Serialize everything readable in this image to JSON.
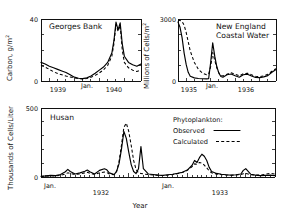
{
  "figure": {
    "background_color": "#ffffff",
    "line_color": "#000000"
  },
  "legend": {
    "heading": "Phytoplankton:",
    "observed_label": "Observed",
    "calculated_label": "Calculated",
    "observed_style": "solid",
    "calculated_style": "dashed"
  },
  "panels": {
    "georges_bank": {
      "title": "Georges Bank",
      "ylabel": "Carbon, g/m",
      "ylabel_sup": "2",
      "ytick_top": "40",
      "ytick_bottom": "0",
      "xticks": [
        "1939",
        "Jan.",
        "1940"
      ]
    },
    "new_england": {
      "title_line1": "New England",
      "title_line2": "Coastal Water",
      "ylabel": "Millions of Cells/m",
      "ylabel_sup": "2",
      "ytick_top": "3000",
      "ytick_bottom": "0",
      "xticks": [
        "1935",
        "Jan.",
        "1936"
      ]
    },
    "husan": {
      "title": "Husan",
      "ylabel": "Thousands of Cells/Liter",
      "ytick_top": "500",
      "ytick_bottom": "0",
      "xticks": [
        "Jan.",
        "1932",
        "Jan.",
        "1933"
      ],
      "xlabel": "Year"
    }
  },
  "chart_data": [
    {
      "id": "georges_bank",
      "type": "line",
      "title": "Georges Bank",
      "xlabel": "",
      "ylabel": "Carbon, g/m2",
      "ylim": [
        0,
        40
      ],
      "yticks": [
        0,
        40
      ],
      "xlim": [
        0,
        24
      ],
      "xtick_labels": [
        "1939",
        "Jan.",
        "1940"
      ],
      "xtick_positions": [
        4.5,
        11.5,
        18
      ],
      "grid": false,
      "legend": "none",
      "series": [
        {
          "name": "Observed",
          "style": "solid",
          "x": [
            0,
            1,
            2,
            3,
            4,
            5,
            6,
            7,
            8,
            9,
            10,
            11,
            12,
            13,
            14,
            15,
            16,
            17,
            17.5,
            18,
            18.5,
            19,
            19.5,
            20,
            21,
            22,
            23,
            24
          ],
          "values": [
            12.0,
            11.0,
            9.5,
            8.5,
            7.5,
            6.5,
            5.5,
            4.0,
            2.5,
            1.8,
            1.5,
            2.0,
            3.2,
            5.0,
            7.0,
            9.0,
            12.0,
            18.0,
            26.0,
            38.0,
            33.0,
            37.5,
            24.0,
            16.0,
            12.0,
            10.5,
            9.5,
            11.0
          ]
        },
        {
          "name": "Calculated",
          "style": "dashed",
          "x": [
            0,
            1,
            2,
            3,
            4,
            5,
            6,
            7,
            8,
            9,
            10,
            11,
            12,
            13,
            14,
            15,
            16,
            17,
            17.5,
            18,
            18.5,
            19,
            19.5,
            20,
            21,
            22,
            23,
            24
          ],
          "values": [
            10.0,
            9.0,
            7.5,
            6.0,
            4.8,
            4.0,
            3.2,
            2.6,
            2.0,
            1.5,
            1.3,
            1.6,
            2.4,
            3.6,
            5.2,
            7.2,
            10.0,
            16.0,
            24.0,
            36.5,
            32.0,
            36.0,
            20.0,
            12.0,
            8.5,
            7.0,
            6.2,
            7.0
          ]
        }
      ]
    },
    {
      "id": "new_england",
      "type": "line",
      "title": "New England Coastal Water",
      "xlabel": "",
      "ylabel": "Millions of Cells/m2",
      "ylim": [
        0,
        3000
      ],
      "yticks": [
        0,
        3000
      ],
      "xlim": [
        0,
        24
      ],
      "xtick_labels": [
        "1935",
        "Jan.",
        "1936"
      ],
      "xtick_positions": [
        2.5,
        8.5,
        17
      ],
      "grid": false,
      "legend": "none",
      "series": [
        {
          "name": "Observed",
          "style": "solid",
          "x": [
            0,
            0.5,
            1,
            1.5,
            2,
            2.5,
            3,
            4,
            5,
            6,
            7,
            7.5,
            8,
            8.5,
            9,
            9.5,
            10,
            10.5,
            11,
            12,
            13,
            14,
            15,
            16,
            17,
            18,
            19,
            20,
            21,
            22,
            23,
            24
          ],
          "values": [
            2850,
            2600,
            2100,
            1350,
            800,
            420,
            230,
            150,
            120,
            110,
            105,
            110,
            900,
            1850,
            1200,
            700,
            380,
            220,
            180,
            300,
            340,
            250,
            180,
            300,
            330,
            240,
            170,
            160,
            200,
            260,
            420,
            560
          ]
        },
        {
          "name": "Calculated",
          "style": "dashed",
          "x": [
            0,
            0.5,
            1,
            1.5,
            2,
            2.5,
            3,
            4,
            5,
            6,
            7,
            7.5,
            8,
            8.5,
            9,
            9.5,
            10,
            10.5,
            11,
            12,
            13,
            14,
            15,
            16,
            17,
            18,
            19,
            20,
            21,
            22,
            23,
            24
          ],
          "values": [
            2950,
            2930,
            2880,
            2700,
            2350,
            1900,
            1450,
            900,
            560,
            380,
            300,
            330,
            700,
            1380,
            1000,
            640,
            400,
            280,
            240,
            330,
            400,
            330,
            250,
            350,
            380,
            300,
            230,
            210,
            250,
            330,
            470,
            600
          ]
        }
      ]
    },
    {
      "id": "husan",
      "type": "line",
      "title": "Husan",
      "xlabel": "Year",
      "ylabel": "Thousands of Cells/Liter",
      "ylim": [
        0,
        500
      ],
      "yticks": [
        0,
        100,
        200,
        300,
        400,
        500
      ],
      "xlim": [
        0,
        48
      ],
      "xtick_labels": [
        "Jan.",
        "1932",
        "Jan.",
        "1933"
      ],
      "xtick_positions": [
        1.5,
        12,
        25.5,
        36
      ],
      "grid": false,
      "legend": "inside-top-right",
      "series": [
        {
          "name": "Observed",
          "style": "solid",
          "x": [
            0,
            1,
            2,
            3,
            4,
            5,
            5.5,
            6,
            7,
            8,
            9,
            9.5,
            10,
            11,
            12,
            13,
            13.5,
            14,
            15,
            15.5,
            16,
            16.5,
            17,
            17.5,
            18,
            18.5,
            19,
            19.5,
            20,
            20.5,
            21,
            22,
            23,
            24,
            25,
            26,
            27,
            28,
            29,
            30,
            31,
            31.5,
            32,
            32.5,
            33,
            33.5,
            34,
            34.5,
            35,
            36,
            37,
            38,
            39,
            40,
            41,
            41.5,
            42,
            42.5,
            43,
            44,
            45,
            46,
            47,
            48
          ],
          "values": [
            5,
            8,
            12,
            10,
            18,
            38,
            55,
            40,
            22,
            30,
            42,
            50,
            38,
            22,
            48,
            60,
            52,
            30,
            18,
            40,
            95,
            200,
            330,
            280,
            180,
            90,
            40,
            25,
            60,
            220,
            60,
            22,
            18,
            14,
            12,
            16,
            20,
            26,
            34,
            50,
            85,
            120,
            105,
            140,
            165,
            150,
            120,
            70,
            40,
            26,
            20,
            16,
            14,
            16,
            22,
            48,
            60,
            40,
            20,
            14,
            10,
            12,
            14,
            10
          ]
        },
        {
          "name": "Calculated",
          "style": "dashed",
          "x": [
            0,
            1,
            2,
            3,
            4,
            5,
            5.5,
            6,
            7,
            8,
            9,
            9.5,
            10,
            11,
            12,
            13,
            13.5,
            14,
            15,
            15.5,
            16,
            16.5,
            17,
            17.5,
            18,
            18.5,
            19,
            19.5,
            20,
            20.5,
            21,
            22,
            23,
            24,
            25,
            26,
            27,
            28,
            29,
            30,
            31,
            31.5,
            32,
            32.5,
            33,
            33.5,
            34,
            34.5,
            35,
            36,
            37,
            38,
            39,
            40,
            41,
            41.5,
            42,
            42.5,
            43,
            44,
            45,
            46,
            47,
            48
          ],
          "values": [
            4,
            6,
            9,
            8,
            12,
            22,
            30,
            26,
            18,
            22,
            30,
            34,
            28,
            18,
            30,
            36,
            32,
            22,
            16,
            40,
            110,
            230,
            360,
            390,
            330,
            230,
            120,
            55,
            30,
            26,
            22,
            18,
            15,
            12,
            11,
            14,
            18,
            24,
            32,
            48,
            75,
            95,
            92,
            105,
            100,
            86,
            66,
            45,
            30,
            22,
            18,
            15,
            13,
            14,
            18,
            24,
            26,
            22,
            16,
            14,
            14,
            20,
            26,
            22
          ]
        }
      ]
    }
  ]
}
